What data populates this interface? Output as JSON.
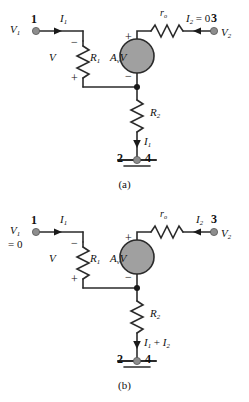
{
  "figure_a": {
    "caption": "(a)",
    "node1_number": "1",
    "node1_voltage": "V",
    "node1_voltage_sub": "1",
    "current_in": "I",
    "current_in_sub": "1",
    "r1_label": "R",
    "r1_label_sub": "1",
    "v_label": "V",
    "v_minus": "−",
    "v_plus": "+",
    "src_label": "A",
    "src_label_sub": "v",
    "src_label_tail": "V",
    "src_plus": "+",
    "src_minus": "−",
    "ro_label": "r",
    "ro_label_sub": "o",
    "i2_label": "I",
    "i2_label_sub": "2",
    "i2_value": "= 0",
    "node3_number": "3",
    "node3_voltage": "V",
    "node3_voltage_sub": "2",
    "r2_label": "R",
    "r2_label_sub": "2",
    "bottom_current": "I",
    "bottom_current_sub": "1",
    "gnd_left_number": "2",
    "gnd_right_number": "4"
  },
  "figure_b": {
    "caption": "(b)",
    "node1_number": "1",
    "node1_voltage": "V",
    "node1_voltage_sub": "1",
    "node1_value": "= 0",
    "current_in": "I",
    "current_in_sub": "1",
    "r1_label": "R",
    "r1_label_sub": "1",
    "v_label": "V",
    "v_minus": "−",
    "v_plus": "+",
    "src_label": "A",
    "src_label_sub": "v",
    "src_label_tail": "V",
    "src_plus": "+",
    "src_minus": "−",
    "ro_label": "r",
    "ro_label_sub": "o",
    "i2_label": "I",
    "i2_label_sub": "2",
    "node3_number": "3",
    "node3_voltage": "V",
    "node3_voltage_sub": "2",
    "r2_label": "R",
    "r2_label_sub": "2",
    "bottom_current": "I",
    "bottom_current_sub": "1",
    "bottom_current_op": "+",
    "bottom_current2": "I",
    "bottom_current2_sub": "2",
    "gnd_left_number": "2",
    "gnd_right_number": "4"
  },
  "colors": {
    "wire": "#2b2b2b",
    "node_dot": "#8d8d8d",
    "source_fill": "#a0a0a0",
    "text": "#111111",
    "background": "#ffffff"
  }
}
